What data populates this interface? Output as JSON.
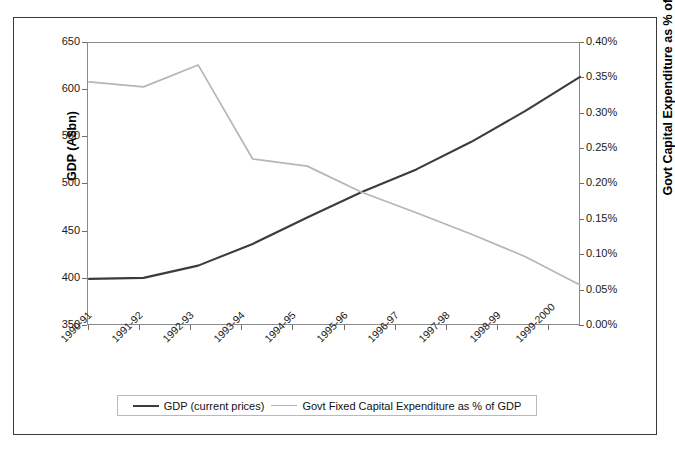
{
  "chart_data": {
    "type": "line",
    "title": "",
    "categories": [
      "1990-91",
      "1991-92",
      "1992-93",
      "1993-94",
      "1994-95",
      "1995-96",
      "1996-97",
      "1997-98",
      "1998-99",
      "1999-2000"
    ],
    "series": [
      {
        "name": "GDP (current prices)",
        "axis": "left",
        "color": "#3c3c3c",
        "values": [
          400,
          401,
          414,
          437,
          465,
          492,
          516,
          545,
          578,
          614
        ]
      },
      {
        "name": "Govt Fixed Capital Expenditure as % of GDP",
        "axis": "right",
        "color": "#b6b6b6",
        "values": [
          0.345,
          0.338,
          0.369,
          0.236,
          0.226,
          0.189,
          0.16,
          0.13,
          0.098,
          0.058
        ]
      }
    ],
    "xlabel": "",
    "ylabel": "GDP (A$bn)",
    "y2label": "Govt Capital Expenditure as % of GDP",
    "ylim": [
      350,
      650
    ],
    "y2lim": [
      0.0,
      0.4
    ],
    "yticks": [
      "350",
      "400",
      "450",
      "500",
      "550",
      "600",
      "650"
    ],
    "y2ticks": [
      "0.00%",
      "0.05%",
      "0.10%",
      "0.15%",
      "0.20%",
      "0.25%",
      "0.30%",
      "0.35%",
      "0.40%"
    ],
    "grid": false,
    "legend_position": "bottom"
  },
  "axes": {
    "left_title": "GDP (A$bn)",
    "right_title": "Govt Capital Expenditure as % of GDP",
    "left_ticks": [
      "650",
      "600",
      "550",
      "500",
      "450",
      "400",
      "350"
    ],
    "right_ticks": [
      "0.40%",
      "0.35%",
      "0.30%",
      "0.25%",
      "0.20%",
      "0.15%",
      "0.10%",
      "0.05%",
      "0.00%"
    ],
    "x_ticks": [
      "1990-91",
      "1991-92",
      "1992-93",
      "1993-94",
      "1994-95",
      "1995-96",
      "1996-97",
      "1997-98",
      "1998-99",
      "1999-2000"
    ]
  },
  "legend": {
    "items": [
      {
        "label": "GDP (current prices)",
        "style": "dark"
      },
      {
        "label": "Govt Fixed Capital Expenditure as % of GDP",
        "style": "light"
      }
    ]
  }
}
